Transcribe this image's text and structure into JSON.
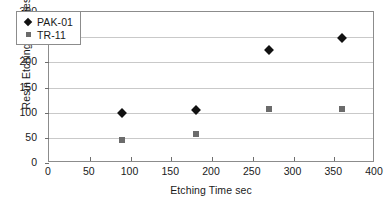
{
  "chart_data": {
    "type": "scatter",
    "title": "",
    "subtitle": "",
    "xlabel": "Etching Time sec",
    "ylabel": "Resin Etching Thickness nm",
    "xlim": [
      0,
      400
    ],
    "ylim": [
      0,
      300
    ],
    "xticks": [
      0,
      50,
      100,
      150,
      200,
      250,
      300,
      350,
      400
    ],
    "yticks": [
      0,
      50,
      100,
      150,
      200,
      250,
      300
    ],
    "xtick_labels": [
      "0",
      "50",
      "100",
      "150",
      "200",
      "250",
      "300",
      "350",
      "400"
    ],
    "ytick_labels": [
      "0",
      "50",
      "100",
      "150",
      "200",
      "250",
      "300"
    ],
    "grid": "horizontal",
    "legend_position": "upper-left-inside",
    "series": [
      {
        "name": "PAK‑01",
        "marker": "diamond",
        "color": "#111111",
        "x": [
          90,
          180,
          270,
          360
        ],
        "values": [
          100,
          105,
          225,
          248
        ]
      },
      {
        "name": "TR‑11",
        "marker": "square",
        "color": "#6b6b6b",
        "x": [
          90,
          180,
          270,
          360
        ],
        "values": [
          45,
          58,
          108,
          107
        ]
      }
    ]
  },
  "legend": {
    "entries": [
      {
        "label": "PAK‑01"
      },
      {
        "label": "TR‑11"
      }
    ]
  }
}
